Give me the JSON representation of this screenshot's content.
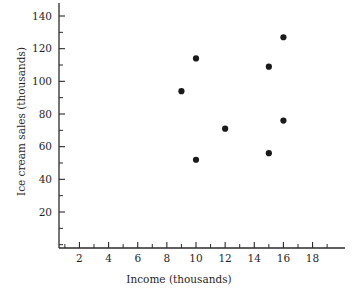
{
  "chart_data": {
    "type": "scatter",
    "title": "",
    "xlabel": "Income (thousands)",
    "ylabel": "Ice cream sales (thousands)",
    "xlim": [
      0,
      19.6
    ],
    "ylim": [
      0,
      148
    ],
    "grid": false,
    "legend": null,
    "x_tick_labels": [
      "2",
      "4",
      "6",
      "8",
      "10",
      "12",
      "14",
      "16",
      "18"
    ],
    "x_tick_values": [
      2,
      4,
      6,
      8,
      10,
      12,
      14,
      16,
      18
    ],
    "x_minor_ticks": [
      1,
      3,
      5,
      7,
      9,
      11,
      13,
      15,
      17,
      19
    ],
    "y_tick_labels": [
      "20",
      "40",
      "60",
      "80",
      "100",
      "120",
      "140"
    ],
    "y_tick_values": [
      20,
      40,
      60,
      80,
      100,
      120,
      140
    ],
    "y_minor_ticks": [
      10,
      30,
      50,
      70,
      90,
      110,
      130
    ],
    "points": [
      {
        "x": 9,
        "y": 94
      },
      {
        "x": 10,
        "y": 114
      },
      {
        "x": 10,
        "y": 52
      },
      {
        "x": 12,
        "y": 71
      },
      {
        "x": 15,
        "y": 109
      },
      {
        "x": 15,
        "y": 56
      },
      {
        "x": 16,
        "y": 127
      },
      {
        "x": 16,
        "y": 76
      }
    ],
    "marker": "filled-circle",
    "marker_color": "#1a1a1a",
    "marker_radius": 3.1,
    "axis_color": "#2b2b2b",
    "background": "#ffffff"
  }
}
